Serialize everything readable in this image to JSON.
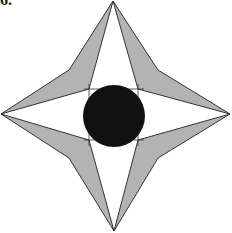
{
  "problem": {
    "number_label": "6."
  },
  "figure": {
    "colors": {
      "arm_fill": "#b3b3b3",
      "outline": "#333333",
      "inner_fill": "#ffffff",
      "circle_fill": "#111111"
    },
    "outer_star": [
      [
        113,
        1
      ],
      [
        158,
        70
      ],
      [
        230,
        114
      ],
      [
        158,
        158
      ],
      [
        114,
        231
      ],
      [
        69,
        158
      ],
      [
        1,
        114
      ],
      [
        69,
        70
      ]
    ],
    "inner_star": [
      [
        113,
        1
      ],
      [
        138,
        89
      ],
      [
        230,
        114
      ],
      [
        138,
        140
      ],
      [
        114,
        231
      ],
      [
        89,
        140
      ],
      [
        1,
        114
      ],
      [
        89,
        89
      ]
    ],
    "circle": {
      "cx": 114,
      "cy": 116,
      "r": 31
    }
  }
}
